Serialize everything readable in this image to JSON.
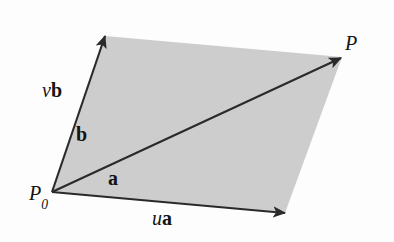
{
  "figure": {
    "kind": "vector-parallelogram-diagram",
    "background_color": "#fdfdfd",
    "fill_color": "#cdcdcd",
    "stroke_color": "#2a2a2a"
  },
  "labels": {
    "origin_point": "P",
    "origin_subscript": "0",
    "terminal_point": "P",
    "vector_vb_scalar": "v",
    "vector_vb_name": "b",
    "vector_b": "b",
    "vector_a": "a",
    "vector_ua_scalar": "u",
    "vector_ua_name": "a"
  },
  "geometry": {
    "points": {
      "P0": [
        52,
        192
      ],
      "vb_tip": [
        105,
        36
      ],
      "ua_tip": [
        285,
        213
      ],
      "P": [
        342,
        57
      ]
    },
    "arrowheads": {
      "b": [
        88,
        96
      ],
      "a": [
        152,
        199
      ]
    }
  }
}
